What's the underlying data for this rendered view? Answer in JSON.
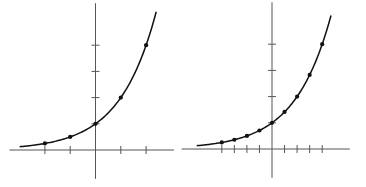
{
  "chart_data": [
    {
      "type": "line",
      "title": "",
      "xlabel": "",
      "ylabel": "",
      "function": "y = 2^x",
      "grid": false,
      "legend": null,
      "x_ticks": [
        -2,
        -1,
        1,
        2
      ],
      "y_ticks": [
        1,
        2,
        3,
        4
      ],
      "xlim": [
        -3.4,
        3.1
      ],
      "ylim": [
        -1.1,
        5.6
      ],
      "points": {
        "x": [
          -2,
          -1,
          0,
          1,
          2
        ],
        "y": [
          0.25,
          0.5,
          1,
          2,
          4
        ]
      },
      "curve_range": [
        -3.0,
        2.4
      ],
      "geom": {
        "ox": 95.5,
        "oy": 150,
        "ux": 25.3,
        "uy": 26.2
      }
    },
    {
      "type": "line",
      "title": "",
      "xlabel": "",
      "ylabel": "",
      "function": "y = 2^x",
      "grid": false,
      "legend": null,
      "x_ticks": [
        -2,
        -1.5,
        -1,
        -0.5,
        0.5,
        1,
        1.5,
        2
      ],
      "y_ticks": [
        1,
        2,
        3,
        4
      ],
      "xlim": [
        -3.6,
        3.1
      ],
      "ylim": [
        -1.1,
        5.6
      ],
      "points": {
        "x": [
          -2,
          -1.5,
          -1,
          -0.5,
          0,
          0.5,
          1,
          1.5,
          2
        ],
        "y": [
          0.25,
          0.354,
          0.5,
          0.707,
          1,
          1.414,
          2,
          2.828,
          4
        ]
      },
      "curve_range": [
        -3.0,
        2.35
      ],
      "geom": {
        "ox": 272,
        "oy": 149,
        "ux": 25.1,
        "uy": 26.2
      }
    }
  ]
}
